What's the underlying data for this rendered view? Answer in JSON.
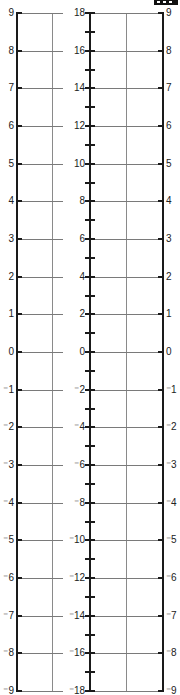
{
  "figure": {
    "type": "number-line-scale-ruler",
    "left_scale": {
      "labels": [
        "9",
        "8",
        "7",
        "6",
        "5",
        "4",
        "3",
        "2",
        "1",
        "0",
        "⁻1",
        "⁻2",
        "⁻3",
        "⁻4",
        "⁻5",
        "⁻6",
        "⁻7",
        "⁻8",
        "⁻9"
      ]
    },
    "center_scale": {
      "labels": [
        "18",
        "16",
        "14",
        "12",
        "10",
        "8",
        "6",
        "4",
        "2",
        "0",
        "⁻2",
        "⁻4",
        "⁻6",
        "⁻8",
        "⁻10",
        "⁻12",
        "⁻14",
        "⁻16",
        "⁻18"
      ]
    },
    "right_scale": {
      "labels": [
        "9",
        "8",
        "7",
        "6",
        "5",
        "4",
        "3",
        "2",
        "1",
        "0",
        "⁻1",
        "⁻2",
        "⁻3",
        "⁻4",
        "⁻5",
        "⁻6",
        "⁻7",
        "⁻8",
        "⁻9"
      ]
    },
    "logo_icon": "publisher-logo-icon"
  },
  "colors": {
    "axis": "#1a1a1a",
    "grid": "#7a7a7a",
    "background": "#ffffff"
  }
}
